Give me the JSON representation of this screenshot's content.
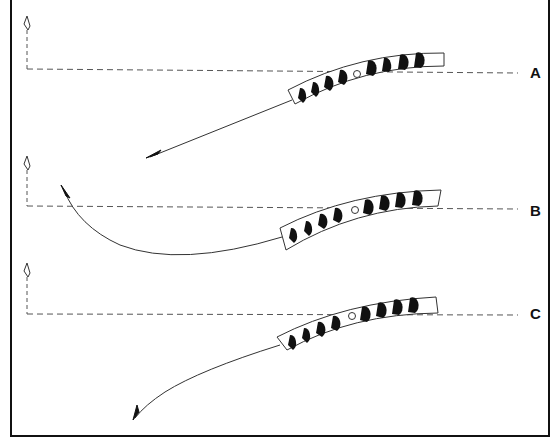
{
  "diagram": {
    "frame": {
      "left": 10,
      "top": 0,
      "right": 549,
      "bottom": 436,
      "color": "#111111"
    },
    "colors": {
      "ink": "#111111",
      "line": "#333333",
      "dash": "#555555",
      "paper": "#ffffff"
    },
    "panels": [
      {
        "id": "A",
        "label": "A",
        "label_pos": {
          "x": 530,
          "y": 62
        },
        "baseline_y": 69,
        "marker_x": 27,
        "marker_top_y": 16,
        "shaft": {
          "tail": [
            292,
            100
          ],
          "head": [
            148,
            157
          ]
        },
        "trajectory": "straight",
        "fletch_count": 8
      },
      {
        "id": "B",
        "label": "B",
        "label_pos": {
          "x": 530,
          "y": 202
        },
        "baseline_y": 206,
        "marker_x": 27,
        "marker_top_y": 156,
        "shaft": {
          "tail": [
            282,
            237
          ],
          "head": [
            62,
            186
          ]
        },
        "trajectory": "curved-back",
        "fletch_count": 8
      },
      {
        "id": "C",
        "label": "C",
        "label_pos": {
          "x": 530,
          "y": 305
        },
        "baseline_y": 314,
        "marker_x": 27,
        "marker_top_y": 263,
        "shaft": {
          "tail": [
            280,
            345
          ],
          "head": [
            133,
            419
          ]
        },
        "trajectory": "curved-down",
        "fletch_count": 8
      }
    ]
  }
}
